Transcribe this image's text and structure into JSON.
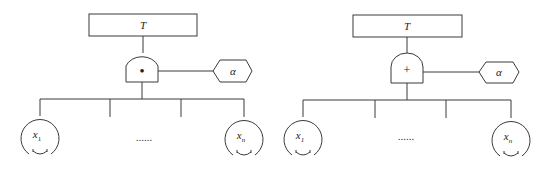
{
  "diagrams": [
    {
      "name": "and-gate-tree",
      "top_event": "T",
      "gate_symbol": "•",
      "gate_type": "AND",
      "condition": "α",
      "inputs": [
        {
          "label": "x",
          "subscript": "1"
        },
        {
          "label": "x",
          "subscript": "n"
        }
      ],
      "ellipsis": "......"
    },
    {
      "name": "or-gate-tree",
      "top_event": "T",
      "gate_symbol": "+",
      "gate_type": "OR",
      "condition": "α",
      "inputs": [
        {
          "label": "x",
          "subscript": "1"
        },
        {
          "label": "x",
          "subscript": "n"
        }
      ],
      "ellipsis": "......"
    }
  ],
  "colors": {
    "stroke": "#3a3a3a",
    "background": "#ffffff"
  }
}
